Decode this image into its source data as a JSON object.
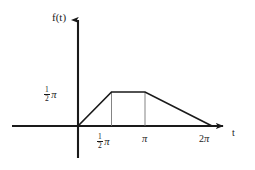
{
  "figure": {
    "axis_color": "#1a1a1a",
    "curve_color": "#1a1a1a",
    "guide_color": "#6e6e6e",
    "background": "#ffffff",
    "y_axis_label": "f(t)",
    "x_axis_label": "t",
    "y_ticks": [
      {
        "numerator": "1",
        "denominator": "2",
        "symbol": "π",
        "text": "½π",
        "value": 1.5708
      }
    ],
    "x_ticks": [
      {
        "coefficient": "",
        "numerator": "1",
        "denominator": "2",
        "symbol": "π",
        "text": "½π",
        "value": 1.5708
      },
      {
        "coefficient": "",
        "numerator": "",
        "denominator": "",
        "symbol": "π",
        "text": "π",
        "value": 3.1416
      },
      {
        "coefficient": "2",
        "numerator": "",
        "denominator": "",
        "symbol": "π",
        "text": "2π",
        "value": 6.2832
      }
    ]
  },
  "chart_data": {
    "type": "line",
    "title": "",
    "subtitle": "",
    "xlabel": "t",
    "ylabel": "f(t)",
    "xlim": [
      -0.85,
      7.2
    ],
    "ylim": [
      -0.72,
      2.45
    ],
    "grid": false,
    "legend": null,
    "xtick_values": [
      1.5708,
      3.1416,
      6.2832
    ],
    "xtick_labels": [
      "½π",
      "π",
      "2π"
    ],
    "ytick_values": [
      1.5708
    ],
    "ytick_labels": [
      "½π"
    ],
    "series": [
      {
        "name": "f(t)",
        "x": [
          0,
          1.5708,
          3.1416,
          6.2832
        ],
        "y": [
          0,
          1.5708,
          1.5708,
          0
        ]
      }
    ],
    "annotations": [
      {
        "name": "guide-line-half-pi",
        "type": "vline",
        "x": 1.5708,
        "y_from": 0,
        "y_to": 1.5708
      },
      {
        "name": "guide-line-pi",
        "type": "vline",
        "x": 3.1416,
        "y_from": 0,
        "y_to": 1.5708
      }
    ]
  }
}
